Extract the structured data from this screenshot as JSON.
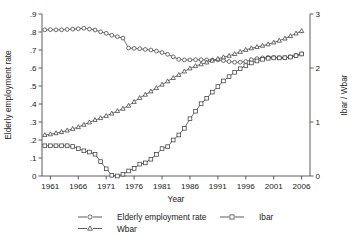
{
  "chart_data": {
    "type": "line",
    "title": "",
    "xlabel": "Year",
    "ylabel": "Elderly employment rate",
    "ylabel_right": "Ibar / Wbar",
    "xlim": [
      1959.5,
      2007.5
    ],
    "ylim": [
      0,
      0.9
    ],
    "ylim_right": [
      0,
      3
    ],
    "grid": false,
    "legend_position": "bottom",
    "xticks": [
      1961,
      1966,
      1971,
      1976,
      1981,
      1986,
      1991,
      1996,
      2001,
      2006
    ],
    "xtick_labels": [
      "1961",
      "1966",
      "1971",
      "1976",
      "1981",
      "1986",
      "1991",
      "1996",
      "2001",
      "2006"
    ],
    "yticks": [
      0,
      0.1,
      0.2,
      0.3,
      0.4,
      0.5,
      0.6,
      0.7,
      0.8,
      0.9
    ],
    "ytick_labels": [
      "0",
      ".1",
      ".2",
      ".3",
      ".4",
      ".5",
      ".6",
      ".7",
      ".8",
      ".9"
    ],
    "yticks_right": [
      0,
      1,
      2,
      3
    ],
    "ytick_labels_right": [
      "0",
      "1",
      "2",
      "3"
    ],
    "x": [
      1960,
      1961,
      1962,
      1963,
      1964,
      1965,
      1966,
      1967,
      1968,
      1969,
      1970,
      1971,
      1972,
      1973,
      1974,
      1975,
      1976,
      1977,
      1978,
      1979,
      1980,
      1981,
      1982,
      1983,
      1984,
      1985,
      1986,
      1987,
      1988,
      1989,
      1990,
      1991,
      1992,
      1993,
      1994,
      1995,
      1996,
      1997,
      1998,
      1999,
      2000,
      2001,
      2002,
      2003,
      2004,
      2005,
      2006
    ],
    "series": [
      {
        "name": "Elderly employment rate",
        "marker": "circle",
        "axis": "left",
        "values": [
          0.812,
          0.813,
          0.812,
          0.812,
          0.814,
          0.816,
          0.818,
          0.821,
          0.816,
          0.811,
          0.801,
          0.793,
          0.782,
          0.774,
          0.766,
          0.711,
          0.709,
          0.707,
          0.703,
          0.7,
          0.694,
          0.686,
          0.676,
          0.662,
          0.648,
          0.645,
          0.645,
          0.646,
          0.646,
          0.645,
          0.644,
          0.645,
          0.641,
          0.636,
          0.632,
          0.632,
          0.636,
          0.646,
          0.652,
          0.656,
          0.659,
          0.659,
          0.657,
          0.657,
          0.662,
          0.67,
          0.678
        ]
      },
      {
        "name": "Ibar",
        "marker": "square",
        "axis": "right",
        "values": [
          0.168,
          0.168,
          0.168,
          0.168,
          0.168,
          0.164,
          0.152,
          0.14,
          0.133,
          0.121,
          0.08,
          0.04,
          0.004,
          0.0,
          0.01,
          0.028,
          0.042,
          0.066,
          0.073,
          0.093,
          0.12,
          0.152,
          0.163,
          0.2,
          0.228,
          0.265,
          0.318,
          0.36,
          0.402,
          0.432,
          0.466,
          0.497,
          0.528,
          0.552,
          0.576,
          0.596,
          0.613,
          0.628,
          0.639,
          0.648,
          0.654,
          0.656,
          0.656,
          0.657,
          0.661,
          0.668,
          0.678
        ]
      },
      {
        "name": "Wbar",
        "marker": "triangle",
        "axis": "right",
        "values": [
          0.228,
          0.232,
          0.238,
          0.245,
          0.253,
          0.262,
          0.272,
          0.285,
          0.298,
          0.311,
          0.322,
          0.334,
          0.347,
          0.361,
          0.374,
          0.391,
          0.412,
          0.434,
          0.452,
          0.47,
          0.489,
          0.508,
          0.526,
          0.545,
          0.562,
          0.581,
          0.598,
          0.611,
          0.621,
          0.631,
          0.641,
          0.651,
          0.66,
          0.668,
          0.678,
          0.69,
          0.701,
          0.71,
          0.717,
          0.724,
          0.732,
          0.742,
          0.752,
          0.764,
          0.778,
          0.792,
          0.806
        ]
      }
    ],
    "legend": [
      {
        "label": "Elderly employment rate",
        "marker": "circle"
      },
      {
        "label": "Ibar",
        "marker": "square"
      },
      {
        "label": "Wbar",
        "marker": "triangle"
      }
    ]
  },
  "colors": {
    "line": "#4a4a4a",
    "marker_fill": "#ffffff",
    "marker_stroke": "#3d3d3d",
    "axis": "#4d4d4d",
    "text": "#1a1a1a",
    "background": "#ffffff"
  }
}
